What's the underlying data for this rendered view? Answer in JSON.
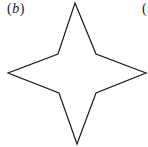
{
  "figure": {
    "label": {
      "open": "(",
      "letter": "b",
      "close": ")"
    },
    "next_label_fragment": "(",
    "shape": {
      "type": "four-pointed-star",
      "stroke_color": "#1a1a1a",
      "fill_color": "#ffffff",
      "stroke_width": 1.2,
      "points": "75,3 96,54 146,73 96,93 77,144 59,93 8,73 58,54"
    }
  }
}
